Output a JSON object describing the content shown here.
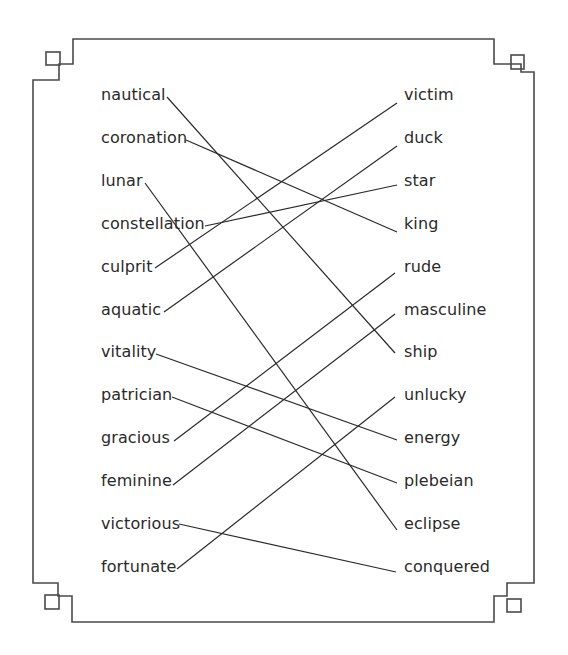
{
  "worksheet": {
    "type": "matching-exercise",
    "left_words": [
      {
        "label": "nautical",
        "y": 97
      },
      {
        "label": "coronation",
        "y": 140
      },
      {
        "label": "lunar",
        "y": 183
      },
      {
        "label": "constellation",
        "y": 226
      },
      {
        "label": "culprit",
        "y": 269
      },
      {
        "label": "aquatic",
        "y": 312
      },
      {
        "label": "vitality",
        "y": 354
      },
      {
        "label": "patrician",
        "y": 397
      },
      {
        "label": "gracious",
        "y": 440
      },
      {
        "label": "feminine",
        "y": 483
      },
      {
        "label": "victorious",
        "y": 526
      },
      {
        "label": "fortunate",
        "y": 569
      }
    ],
    "right_words": [
      {
        "label": "victim",
        "y": 97
      },
      {
        "label": "duck",
        "y": 140
      },
      {
        "label": "star",
        "y": 183
      },
      {
        "label": "king",
        "y": 226
      },
      {
        "label": "rude",
        "y": 269
      },
      {
        "label": "masculine",
        "y": 312
      },
      {
        "label": "ship",
        "y": 354
      },
      {
        "label": "unlucky",
        "y": 397
      },
      {
        "label": "energy",
        "y": 440
      },
      {
        "label": "plebeian",
        "y": 483
      },
      {
        "label": "eclipse",
        "y": 526
      },
      {
        "label": "conquered",
        "y": 569
      }
    ],
    "connections": [
      {
        "from": "nautical",
        "to": "ship",
        "x1": 167,
        "y1": 97,
        "x2": 395,
        "y2": 353
      },
      {
        "from": "coronation",
        "to": "king",
        "x1": 186,
        "y1": 140,
        "x2": 397,
        "y2": 232
      },
      {
        "from": "lunar",
        "to": "eclipse",
        "x1": 145,
        "y1": 183,
        "x2": 397,
        "y2": 530
      },
      {
        "from": "constellation",
        "to": "star",
        "x1": 205,
        "y1": 226,
        "x2": 397,
        "y2": 185
      },
      {
        "from": "culprit",
        "to": "victim",
        "x1": 155,
        "y1": 268,
        "x2": 397,
        "y2": 103
      },
      {
        "from": "aquatic",
        "to": "duck",
        "x1": 164,
        "y1": 312,
        "x2": 397,
        "y2": 146
      },
      {
        "from": "vitality",
        "to": "energy",
        "x1": 156,
        "y1": 354,
        "x2": 397,
        "y2": 440
      },
      {
        "from": "patrician",
        "to": "plebeian",
        "x1": 172,
        "y1": 397,
        "x2": 397,
        "y2": 483
      },
      {
        "from": "gracious",
        "to": "rude",
        "x1": 174,
        "y1": 441,
        "x2": 395,
        "y2": 273
      },
      {
        "from": "feminine",
        "to": "masculine",
        "x1": 173,
        "y1": 485,
        "x2": 395,
        "y2": 314
      },
      {
        "from": "victorious",
        "to": "conquered",
        "x1": 179,
        "y1": 524,
        "x2": 396,
        "y2": 572
      },
      {
        "from": "fortunate",
        "to": "unlucky",
        "x1": 177,
        "y1": 569,
        "x2": 395,
        "y2": 397
      }
    ],
    "colors": {
      "frame": "#4a4a4a",
      "line": "#2a2a2a",
      "text": "#2a2a2a"
    }
  }
}
